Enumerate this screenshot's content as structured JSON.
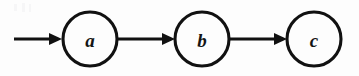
{
  "figure": {
    "kind": "state-chain-diagram",
    "width": 359,
    "height": 76,
    "background_color": "#fdfdfd",
    "stroke_color": "#111111",
    "label_color": "#151515",
    "baseline_y": 39
  },
  "nodes": [
    {
      "id": "a",
      "label": "a",
      "center_x": 90,
      "center_y": 39,
      "radius": 27
    },
    {
      "id": "b",
      "label": "b",
      "center_x": 202,
      "center_y": 39,
      "radius": 27
    },
    {
      "id": "c",
      "label": "c",
      "center_x": 314,
      "center_y": 39,
      "radius": 27
    }
  ],
  "edges": [
    {
      "id": "start-to-a",
      "from": "",
      "to": "a",
      "label": "",
      "x_start": 14,
      "x_end": 62,
      "y": 39,
      "arrowhead": true
    },
    {
      "id": "a-to-b",
      "from": "a",
      "to": "b",
      "label": "",
      "x_start": 117,
      "x_end": 175,
      "y": 39,
      "arrowhead": true
    },
    {
      "id": "b-to-c",
      "from": "b",
      "to": "c",
      "label": "",
      "x_start": 229,
      "x_end": 287,
      "y": 39,
      "arrowhead": true
    }
  ],
  "arrowhead": {
    "length": 13,
    "half_height": 6
  }
}
